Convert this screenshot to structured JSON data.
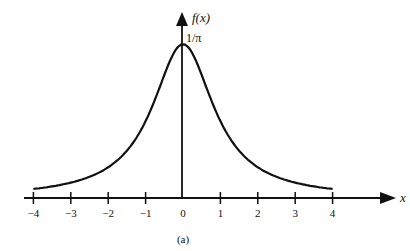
{
  "chart_data": {
    "type": "line",
    "title": "",
    "caption": "(a)",
    "xlabel": "x",
    "ylabel": "f(x)",
    "y_annotation": "1/π",
    "function": "f(x) = 1 / (π (1 + x²))",
    "xlim": [
      -4,
      4
    ],
    "xticks": [
      -4,
      -3,
      -2,
      -1,
      0,
      1,
      2,
      3,
      4
    ],
    "x": [
      -4,
      -3,
      -2,
      -1.5,
      -1,
      -0.5,
      0,
      0.5,
      1,
      1.5,
      2,
      3,
      4
    ],
    "values": [
      0.0187,
      0.0318,
      0.0637,
      0.0979,
      0.1592,
      0.2546,
      0.3183,
      0.2546,
      0.1592,
      0.0979,
      0.0637,
      0.0318,
      0.0187
    ],
    "grid": false,
    "legend": null
  },
  "labels": {
    "y_axis": "f(x)",
    "peak": "1/π",
    "x_axis": "x",
    "caption": "(a)",
    "ticks": [
      "−4",
      "−3",
      "−2",
      "−1",
      "0",
      "1",
      "2",
      "3",
      "4"
    ]
  }
}
